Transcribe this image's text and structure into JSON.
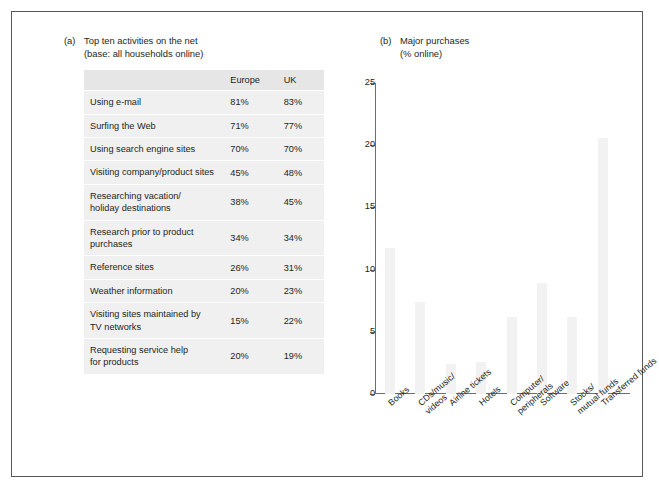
{
  "figure": {
    "panel_a": {
      "letter": "(a)",
      "title": "Top ten activities on the net",
      "subtitle": "(base: all households online)",
      "columns": [
        "",
        "Europe",
        "UK"
      ],
      "rows": [
        {
          "label": "Using e-mail",
          "europe": "81%",
          "uk": "83%"
        },
        {
          "label": "Surfing the Web",
          "europe": "71%",
          "uk": "77%"
        },
        {
          "label": "Using search engine sites",
          "europe": "70%",
          "uk": "70%"
        },
        {
          "label": "Visiting company/product sites",
          "europe": "45%",
          "uk": "48%"
        },
        {
          "label": "Researching vacation/\nholiday destinations",
          "europe": "38%",
          "uk": "45%"
        },
        {
          "label": "Research prior to product\npurchases",
          "europe": "34%",
          "uk": "34%"
        },
        {
          "label": "Reference sites",
          "europe": "26%",
          "uk": "31%"
        },
        {
          "label": "Weather information",
          "europe": "20%",
          "uk": "23%"
        },
        {
          "label": "Visiting sites maintained by\nTV networks",
          "europe": "15%",
          "uk": "22%"
        },
        {
          "label": "Requesting service help\nfor products",
          "europe": "20%",
          "uk": "19%"
        }
      ]
    },
    "panel_b": {
      "letter": "(b)",
      "title": "Major purchases",
      "subtitle": "(% online)"
    }
  },
  "chart_data": {
    "type": "bar",
    "title": "Major purchases",
    "subtitle": "(% online)",
    "xlabel": "",
    "ylabel": "",
    "ylim": [
      0,
      25
    ],
    "yticks": [
      0,
      5,
      10,
      15,
      20,
      25
    ],
    "grid": false,
    "legend": "none",
    "bar_color": "#f2f2f2",
    "categories": [
      "Books",
      "CDs/music/\nvideos",
      "Airline tickets",
      "Hotels",
      "Computer/\nperipherals",
      "Software",
      "Stocks/\nmutual funds",
      "Transferred funds"
    ],
    "values": [
      11.7,
      7.4,
      2.4,
      2.6,
      6.2,
      8.9,
      6.2,
      20.6
    ]
  }
}
